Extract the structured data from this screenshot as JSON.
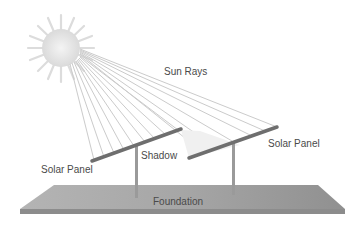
{
  "diagram": {
    "labels": {
      "sun_rays": "Sun Rays",
      "solar_panel_left": "Solar Panel",
      "solar_panel_right": "Solar Panel",
      "shadow": "Shadow",
      "foundation": "Foundation"
    },
    "colors": {
      "sun": "#e6e6e6",
      "rays": "#c8c8c8",
      "panel": "#6e6e6e",
      "post": "#9a9a9a",
      "foundation_top": "#a8a8a8",
      "foundation_edge": "#8a8a8a",
      "text": "#4a4a4a"
    }
  }
}
